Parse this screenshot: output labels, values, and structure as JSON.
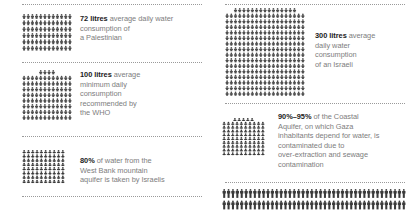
{
  "figure": {
    "type": "pictogram-infographic",
    "columns": 2,
    "background_color": "#ffffff",
    "text_color": "#7d7d7d",
    "highlight_color": "#1a1a1a",
    "icon_color": "#444444",
    "icon_name": "person-icon",
    "rule_color": "#9a9a9a"
  },
  "chart_data": {
    "type": "pictogram",
    "unit": "person icon",
    "facts": [
      {
        "id": "palestinian-consumption",
        "value": 72,
        "value_label": "72 litres",
        "unit_label": "litres",
        "description": "average daily water consumption of a Palestinian",
        "icon_columns": 12,
        "icon_rows": 6,
        "icon_count": 72,
        "partial_row_count": 0,
        "icon_shade": "medium"
      },
      {
        "id": "who-minimum",
        "value": 100,
        "value_label": "100 litres",
        "unit_label": "litres",
        "description": "average minimum daily consumption recommended by the WHO",
        "icon_columns": 12,
        "icon_rows": 8,
        "icon_count": 100,
        "partial_row_count": 4,
        "icon_shade": "medium"
      },
      {
        "id": "west-bank-aquifer",
        "value": 80,
        "value_label": "80%",
        "unit_label": "%",
        "description": "of water from the West Bank mountain aquifer is taken by Israelis",
        "icon_columns": 10,
        "icon_rows": 8,
        "icon_count": 80,
        "partial_row_count": 0,
        "icon_shade": "dark"
      },
      {
        "id": "israeli-consumption",
        "value": 300,
        "value_label": "300 litres",
        "unit_label": "litres",
        "description": "average daily water consumption of an Israeli",
        "icon_columns": 19,
        "icon_rows": 15,
        "icon_count": 300,
        "partial_row_count": 15,
        "icon_shade": "medium"
      },
      {
        "id": "coastal-aquifer",
        "value_label": "90%–95%",
        "value_min": 90,
        "value_max": 95,
        "unit_label": "%",
        "description": "of the Coastal Aquifer, on which Gaza inhabitants depend for water, is contaminated due to over-extraction and sewage contamination",
        "icon_columns": 10,
        "icon_rows": 9,
        "icon_count": 95,
        "partial_row_count": 5,
        "icon_shade": "dark"
      }
    ]
  },
  "left_column": {
    "fact_1": {
      "highlight": "72 litres",
      "rest": " average daily water consumption of",
      "line2": "a Palestinian"
    },
    "fact_2": {
      "highlight": "100 litres",
      "rest": " average",
      "line2": "minimum daily",
      "line3": "consumption",
      "line4": "recommended by",
      "line5": "the WHO"
    },
    "fact_3": {
      "highlight": "80%",
      "rest": " of water from the",
      "line2": "West Bank mountain",
      "line3": "aquifer is taken by Israelis"
    }
  },
  "right_column": {
    "fact_1": {
      "highlight": "300 litres",
      "rest": " average",
      "line2": "daily water",
      "line3": "consumption",
      "line4": "of an Israeli"
    },
    "fact_2": {
      "highlight": "90%–95%",
      "rest": "  of the Coastal",
      "line2": "Aquifer, on which Gaza",
      "line3": "inhabitants depend for water, is",
      "line4": "contaminated due to",
      "line5": "over-extraction and sewage",
      "line6": "contamination"
    }
  }
}
